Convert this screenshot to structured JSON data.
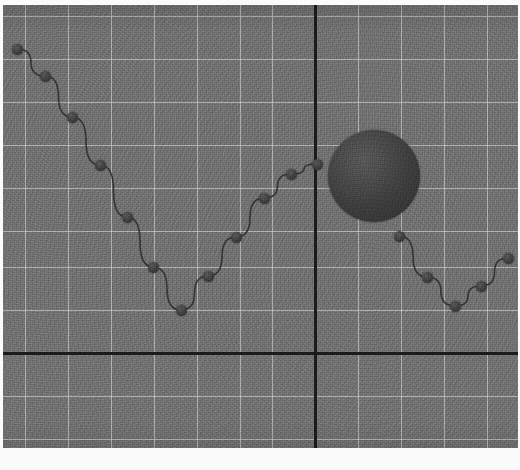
{
  "figure": {
    "title": "",
    "background_color": "#ffffff",
    "panel_color": "#6f6f6f",
    "grid_color": "#e1e1e1",
    "axis_color": "#1a1a1a",
    "marker_color": "#3c3c3c",
    "line_color": "#2f2f2f",
    "texture": "grainy-noise",
    "panel": {
      "x": 3,
      "y": 5,
      "width": 515,
      "height": 443
    }
  },
  "chart_data": {
    "type": "scatter",
    "title": "",
    "xlabel": "",
    "ylabel": "",
    "grid": true,
    "legend": "none",
    "xlim": [
      0,
      515
    ],
    "ylim": [
      0,
      443
    ],
    "axes": {
      "origin_px": {
        "x": 312,
        "y": 348
      },
      "vertical_axis_px": 312,
      "horizontal_axis_px": 348,
      "grid_spacing_px": {
        "x": 43,
        "y": 43
      },
      "vertical_gridlines_px": [
        22,
        65,
        108,
        151,
        194,
        237,
        269,
        355,
        398,
        441,
        484
      ],
      "horizontal_gridlines_px": [
        11,
        54,
        97,
        140,
        183,
        226,
        262,
        305,
        391,
        434
      ]
    },
    "series": [
      {
        "name": "series-1",
        "marker": "circle",
        "marker_size_px": 11,
        "connected": true,
        "points": [
          {
            "x": 14,
            "y": 44
          },
          {
            "x": 42,
            "y": 71
          },
          {
            "x": 69,
            "y": 112
          },
          {
            "x": 97,
            "y": 160
          },
          {
            "x": 124,
            "y": 212
          },
          {
            "x": 150,
            "y": 262
          },
          {
            "x": 178,
            "y": 305
          },
          {
            "x": 205,
            "y": 271
          },
          {
            "x": 233,
            "y": 232
          },
          {
            "x": 261,
            "y": 193
          },
          {
            "x": 288,
            "y": 169
          },
          {
            "x": 314,
            "y": 159
          },
          {
            "x": 396,
            "y": 231
          },
          {
            "x": 424,
            "y": 272
          },
          {
            "x": 452,
            "y": 301
          },
          {
            "x": 478,
            "y": 281
          },
          {
            "x": 505,
            "y": 253
          }
        ]
      }
    ],
    "annotations": [
      {
        "name": "large-filled-circle",
        "shape": "circle",
        "center_x": 371,
        "center_y": 171,
        "radius": 46,
        "color": "#3c3c3c",
        "filled": true
      }
    ]
  }
}
